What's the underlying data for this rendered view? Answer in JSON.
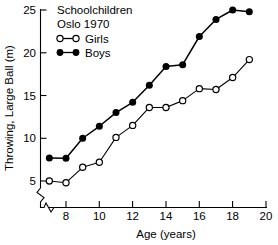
{
  "chart_data": {
    "type": "line",
    "title_lines": [
      "Schoolchildren",
      "Oslo 1970"
    ],
    "xlabel": "Age (years)",
    "ylabel": "Throwing, Large Ball (m)",
    "xlim": [
      6.6,
      20
    ],
    "ylim": [
      4.2,
      25.8
    ],
    "xticks": [
      8,
      10,
      12,
      14,
      16,
      18,
      20
    ],
    "yticks": [
      5,
      10,
      15,
      20,
      25
    ],
    "xtick_labels": [
      "8",
      "10",
      "12",
      "14",
      "16",
      "18",
      "20"
    ],
    "ytick_labels": [
      "5",
      "10",
      "15",
      "20",
      "25"
    ],
    "grid": false,
    "axis_break_x": true,
    "axis_break_y": true,
    "legend_position": "top-left",
    "x": [
      7,
      8,
      9,
      10,
      11,
      12,
      13,
      14,
      15,
      16,
      17,
      18,
      19
    ],
    "series": [
      {
        "name": "Girls",
        "marker": "open-circle",
        "color": "#000000",
        "values": [
          5.0,
          4.8,
          6.6,
          7.2,
          10.1,
          11.5,
          13.6,
          13.6,
          14.4,
          15.8,
          15.7,
          17.1,
          19.2
        ]
      },
      {
        "name": "Boys",
        "marker": "filled-circle",
        "color": "#000000",
        "values": [
          7.7,
          7.65,
          10.0,
          11.4,
          13.0,
          14.2,
          16.2,
          18.4,
          18.6,
          21.9,
          23.9,
          25.0,
          24.8
        ]
      }
    ]
  },
  "legend": {
    "items": [
      {
        "label": "Girls",
        "marker": "open-circle"
      },
      {
        "label": "Boys",
        "marker": "filled-circle"
      }
    ]
  },
  "axes": {
    "x_title": "Age (years)",
    "y_title": "Throwing, Large Ball (m)"
  }
}
